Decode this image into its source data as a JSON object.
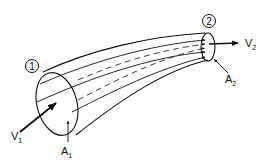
{
  "diagram": {
    "labels": {
      "section1": "1",
      "section2": "2",
      "v1_main": "V",
      "v1_sub": "1",
      "v2_main": "V",
      "v2_sub": "2",
      "a1_main": "A",
      "a1_sub": "1",
      "a2_main": "A",
      "a2_sub": "2"
    },
    "colors": {
      "line": "#111111",
      "background": "#ffffff"
    }
  }
}
